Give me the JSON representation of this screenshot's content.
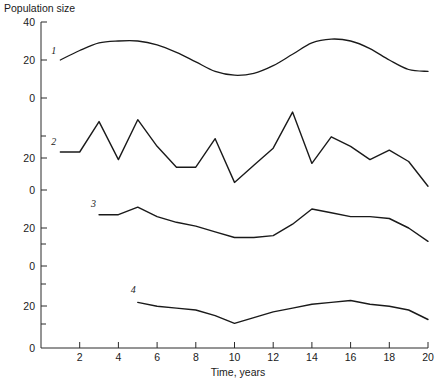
{
  "chart_data": {
    "type": "line",
    "title": "Population size",
    "xlabel": "Time, years",
    "ylabel": "Population size",
    "grid": false,
    "legend": "inline-curve-labels",
    "xlim": [
      0,
      20
    ],
    "xticks": [
      2,
      4,
      6,
      8,
      10,
      12,
      14,
      16,
      18,
      20
    ],
    "xticklabels": [
      "2",
      "4",
      "6",
      "8",
      "10",
      "12",
      "14",
      "16",
      "18",
      "20"
    ],
    "y_axis_note": "Stacked offset axis: four panels share one vertical axis, each panel has its own 0-40 scale",
    "yticklabels": [
      "40",
      "20",
      "0",
      "20",
      "0",
      "20",
      "0",
      "20",
      "0"
    ],
    "series": [
      {
        "name": "1",
        "label": "1",
        "style": "smooth",
        "x": [
          1,
          2,
          3,
          4,
          5,
          6,
          7,
          8,
          9,
          10,
          11,
          12,
          13,
          14,
          15,
          16,
          17,
          18,
          19,
          20
        ],
        "values": [
          20,
          25,
          29,
          30,
          30,
          28,
          24,
          19,
          14,
          12,
          13,
          17,
          23,
          29,
          31,
          30,
          26,
          20,
          15,
          14
        ]
      },
      {
        "name": "2",
        "label": "2",
        "style": "zigzag",
        "x": [
          1,
          2,
          3,
          4,
          5,
          6,
          7,
          8,
          9,
          10,
          11,
          12,
          13,
          14,
          15,
          16,
          17,
          18,
          19,
          20
        ],
        "values": [
          20,
          20,
          36,
          16,
          37,
          23,
          12,
          12,
          27,
          4,
          13,
          22,
          41,
          14,
          28,
          23,
          16,
          21,
          15,
          2
        ]
      },
      {
        "name": "3",
        "label": "3",
        "style": "piecewise",
        "x": [
          3,
          4,
          5,
          6,
          7,
          8,
          9,
          10,
          11,
          12,
          13,
          14,
          15,
          16,
          17,
          18,
          19,
          20
        ],
        "values": [
          27,
          27,
          31,
          26,
          23,
          21,
          18,
          15,
          15,
          16,
          22,
          30,
          28,
          26,
          26,
          25,
          20,
          13
        ]
      },
      {
        "name": "4",
        "label": "4",
        "style": "piecewise",
        "x": [
          5,
          6,
          7,
          8,
          9,
          10,
          11,
          12,
          13,
          14,
          15,
          16,
          17,
          18,
          19,
          20
        ],
        "values": [
          24,
          22,
          21,
          20,
          17,
          13,
          16,
          19,
          21,
          23,
          24,
          25,
          23,
          22,
          20,
          15
        ]
      }
    ]
  },
  "colors": {
    "curve": "#1a1a1a",
    "axis": "#2a2a2a",
    "background": "#ffffff"
  }
}
